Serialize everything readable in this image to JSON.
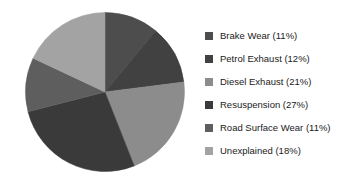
{
  "chart_data": {
    "type": "pie",
    "title": "",
    "subtitle": "",
    "xlabel": "",
    "ylabel": "",
    "grid": false,
    "legend_position": "right",
    "start_angle_deg": 0,
    "direction": "clockwise",
    "categories": [
      "Brake Wear",
      "Petrol Exhaust",
      "Diesel Exhaust",
      "Resuspension",
      "Road Surface Wear",
      "Unexplained"
    ],
    "values": [
      11,
      12,
      21,
      27,
      11,
      18
    ],
    "unit": "%",
    "colors": [
      "#4d4d4d",
      "#414141",
      "#8c8c8c",
      "#3a3a3a",
      "#5e5e5e",
      "#a3a3a3"
    ],
    "legend_entries": [
      "Brake Wear (11%)",
      "Petrol Exhaust (12%)",
      "Diesel Exhaust (21%)",
      "Resuspension (27%)",
      "Road Surface Wear (11%)",
      "Unexplained (18%)"
    ],
    "slices": [
      {
        "label": "Brake Wear",
        "value": 11,
        "legend": "Brake Wear (11%)",
        "color": "#4d4d4d"
      },
      {
        "label": "Petrol Exhaust",
        "value": 12,
        "legend": "Petrol Exhaust (12%)",
        "color": "#414141"
      },
      {
        "label": "Diesel Exhaust",
        "value": 21,
        "legend": "Diesel Exhaust (21%)",
        "color": "#8c8c8c"
      },
      {
        "label": "Resuspension",
        "value": 27,
        "legend": "Resuspension (27%)",
        "color": "#3a3a3a"
      },
      {
        "label": "Road Surface Wear",
        "value": 11,
        "legend": "Road Surface Wear (11%)",
        "color": "#5e5e5e"
      },
      {
        "label": "Unexplained",
        "value": 18,
        "legend": "Unexplained (18%)",
        "color": "#a3a3a3"
      }
    ]
  },
  "figure": {
    "background": "#ffffff",
    "text_color": "#1a1a1a"
  }
}
